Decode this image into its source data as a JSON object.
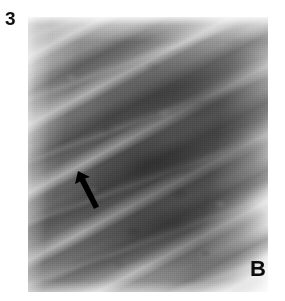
{
  "figure": {
    "number": "3",
    "panel_label": "B",
    "modality": "chest-radiograph",
    "arrow_icon_name": "annotation-arrow-icon"
  },
  "colors": {
    "page_background": "#ffffff",
    "text": "#111111",
    "arrow": "#000000",
    "film_light": "#cdcdcd",
    "film_mid": "#8a8a8a",
    "film_dark": "#4a4a4a"
  },
  "image": {
    "alt": "Coned-down frontal chest radiograph showing obliquely oriented ribs with intervening lucent intercostal spaces; a black arrow in the left mid-zone indicates a focal lesion.",
    "left": 28,
    "top": 17,
    "width": 240,
    "height": 275
  },
  "annotations": [
    {
      "name": "arrow",
      "points_to": "left mid-lung focal opacity",
      "x": 72,
      "y": 167,
      "width": 34,
      "height": 46,
      "direction": "up-left"
    }
  ]
}
